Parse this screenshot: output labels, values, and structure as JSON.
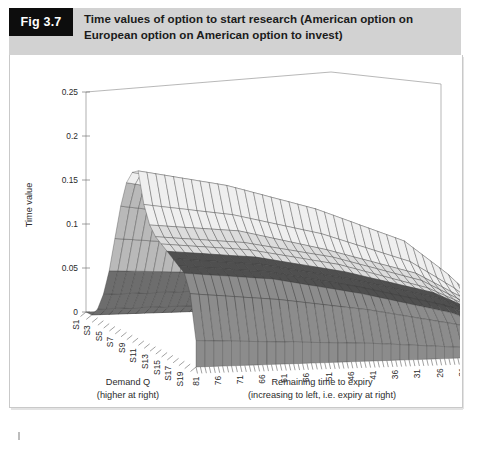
{
  "figure": {
    "tag": "Fig 3.7",
    "title_line1": "Time values of option to start research (American option on",
    "title_line2": "European option on American option to invest)",
    "tag_bg": "#0d0d0d",
    "band_bg": "#d2d2d2"
  },
  "chart_data": {
    "type": "surface",
    "title": "Time values of option to start research (American option on European option on American option to invest)",
    "zlabel": "Time value",
    "xlabel": "Demand Q",
    "xlabel_sub": "(higher at right)",
    "ylabel": "Remaining time to expiry",
    "ylabel_sub": "(increasing to left, i.e. expiry at right)",
    "zlim": [
      0,
      0.25
    ],
    "zticks": [
      "0",
      "0.05",
      "0.1",
      "0.15",
      "0.2",
      "0.25"
    ],
    "ztick_values": [
      0,
      0.05,
      0.1,
      0.15,
      0.2,
      0.25
    ],
    "grid": false,
    "legend": "none",
    "x_categories": [
      "S1",
      "S2",
      "S3",
      "S4",
      "S5",
      "S6",
      "S7",
      "S8",
      "S9",
      "S10",
      "S11",
      "S12",
      "S13",
      "S14",
      "S15",
      "S16",
      "S17",
      "S18",
      "S19",
      "S20"
    ],
    "x_tick_labels": [
      "S1",
      "S3",
      "S5",
      "S7",
      "S9",
      "S11",
      "S13",
      "S15",
      "S17",
      "S19"
    ],
    "y_tick_labels": [
      "81",
      "76",
      "71",
      "66",
      "61",
      "56",
      "51",
      "46",
      "41",
      "36",
      "31",
      "26",
      "21",
      "16",
      "11",
      "6",
      "1"
    ],
    "y_range": [
      1,
      81
    ],
    "y_direction": "decreasing-to-right",
    "surface_peak": {
      "z": 0.19,
      "x_category": "S10",
      "y_time": 81
    },
    "surface_note": "Ridge of time value peaking near Q mid-range at longest maturity, decaying to zero at expiry (right) and at low/high demand edges",
    "series": [
      {
        "name": "time-to-expiry 81",
        "values": [
          0.0,
          0.0,
          0.01,
          0.03,
          0.06,
          0.1,
          0.14,
          0.17,
          0.185,
          0.19,
          0.155,
          0.135,
          0.125,
          0.12,
          0.115,
          0.11,
          0.105,
          0.1,
          0.08,
          0.03
        ]
      },
      {
        "name": "time-to-expiry 61",
        "values": [
          0.0,
          0.0,
          0.01,
          0.03,
          0.055,
          0.09,
          0.125,
          0.15,
          0.165,
          0.17,
          0.14,
          0.125,
          0.115,
          0.11,
          0.105,
          0.1,
          0.095,
          0.09,
          0.07,
          0.025
        ]
      },
      {
        "name": "time-to-expiry 41",
        "values": [
          0.0,
          0.0,
          0.008,
          0.025,
          0.045,
          0.075,
          0.1,
          0.12,
          0.135,
          0.14,
          0.115,
          0.1,
          0.095,
          0.09,
          0.085,
          0.08,
          0.075,
          0.07,
          0.055,
          0.02
        ]
      },
      {
        "name": "time-to-expiry 21",
        "values": [
          0.0,
          0.0,
          0.005,
          0.015,
          0.03,
          0.05,
          0.07,
          0.085,
          0.095,
          0.1,
          0.08,
          0.07,
          0.065,
          0.06,
          0.058,
          0.055,
          0.05,
          0.045,
          0.035,
          0.012
        ]
      },
      {
        "name": "time-to-expiry 11",
        "values": [
          0.0,
          0.0,
          0.003,
          0.008,
          0.018,
          0.03,
          0.042,
          0.052,
          0.058,
          0.06,
          0.048,
          0.042,
          0.038,
          0.036,
          0.034,
          0.032,
          0.03,
          0.027,
          0.02,
          0.007
        ]
      },
      {
        "name": "time-to-expiry 1",
        "values": [
          0.0,
          0.0,
          0.0,
          0.001,
          0.002,
          0.004,
          0.006,
          0.008,
          0.009,
          0.01,
          0.008,
          0.007,
          0.006,
          0.006,
          0.005,
          0.005,
          0.004,
          0.004,
          0.003,
          0.001
        ]
      }
    ]
  }
}
